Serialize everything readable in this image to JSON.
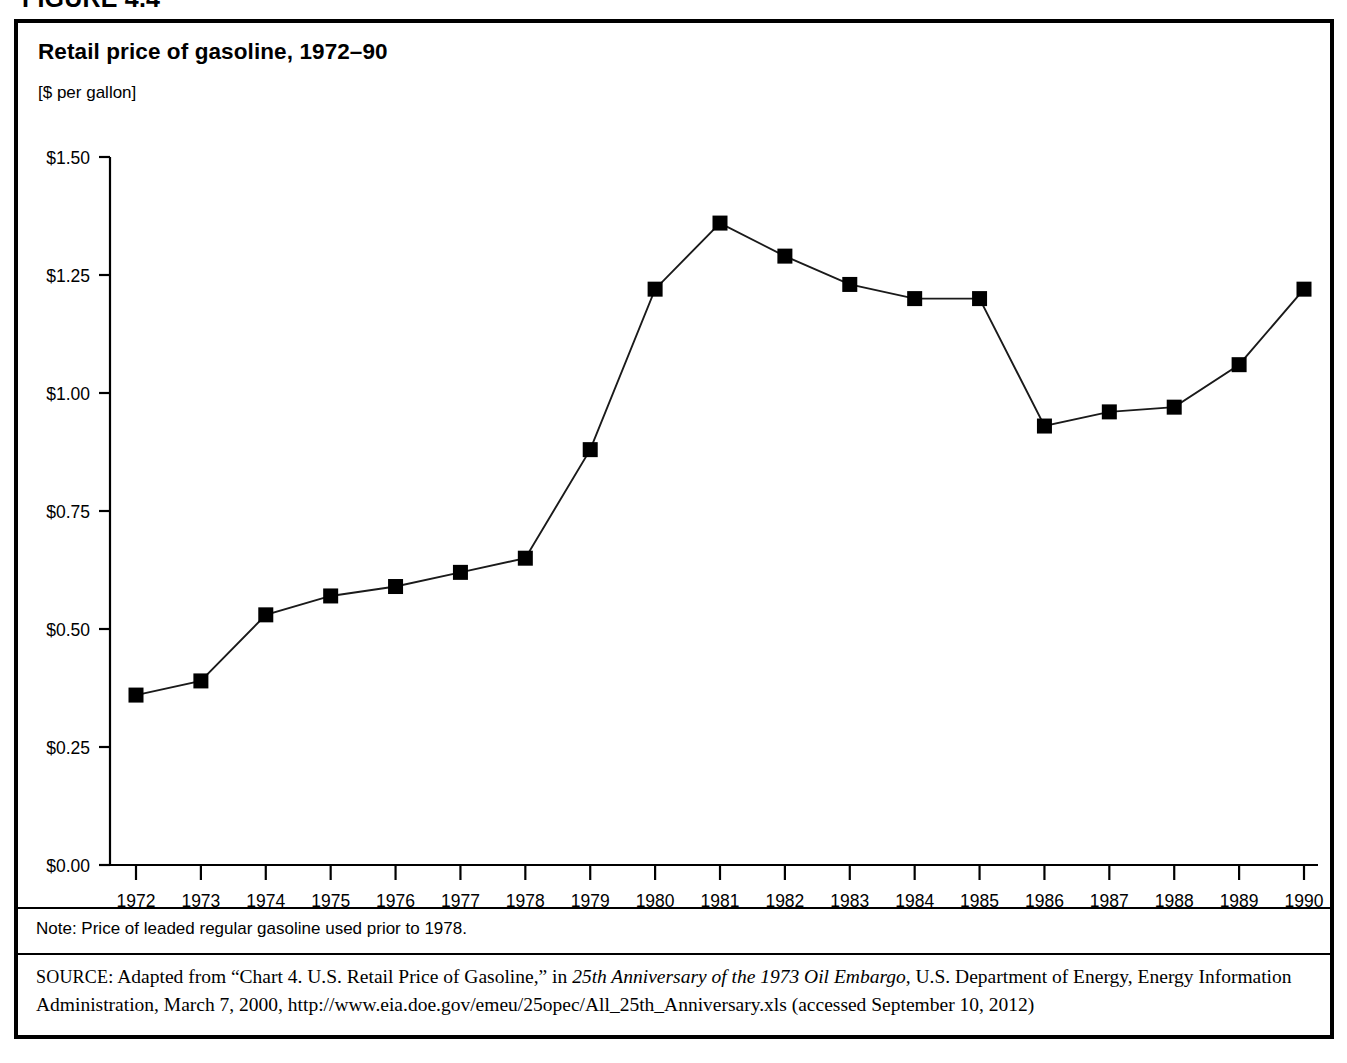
{
  "figure": {
    "label": "FIGURE 4.4"
  },
  "chart": {
    "title": "Retail price of gasoline, 1972–90",
    "units": "[$ per gallon]"
  },
  "footer": {
    "note": "Note: Price of leaded regular gasoline used prior to 1978.",
    "source_prefix": "SOURCE:",
    "source_part1": " Adapted from “Chart 4. U.S. Retail Price of Gasoline,” in ",
    "source_italic": "25th Anniversary of the 1973 Oil Embargo",
    "source_part2": ", U.S. Department of Energy, Energy Information Administration, March 7, 2000, http://www.eia.doe.gov/emeu/25opec/All_25th_Anniversary.xls (accessed September 10, 2012)"
  },
  "chart_data": {
    "type": "line",
    "title": "Retail price of gasoline, 1972–90",
    "subtitle": "[$ per gallon]",
    "xlabel": "",
    "ylabel": "[$ per gallon]",
    "grid": false,
    "legend": null,
    "xlim": [
      1972,
      1990
    ],
    "ylim": [
      0.0,
      1.5
    ],
    "ytick_labels": [
      "$0.00",
      "$0.25",
      "$0.50",
      "$0.75",
      "$1.00",
      "$1.25",
      "$1.50"
    ],
    "ytick_values": [
      0.0,
      0.25,
      0.5,
      0.75,
      1.0,
      1.25,
      1.5
    ],
    "categories": [
      1972,
      1973,
      1974,
      1975,
      1976,
      1977,
      1978,
      1979,
      1980,
      1981,
      1982,
      1983,
      1984,
      1985,
      1986,
      1987,
      1988,
      1989,
      1990
    ],
    "xtick_labels": [
      "1972",
      "1973",
      "1974",
      "1975",
      "1976",
      "1977",
      "1978",
      "1979",
      "1980",
      "1981",
      "1982",
      "1983",
      "1984",
      "1985",
      "1986",
      "1987",
      "1988",
      "1989",
      "1990"
    ],
    "values": [
      0.36,
      0.39,
      0.53,
      0.57,
      0.59,
      0.62,
      0.65,
      0.88,
      1.22,
      1.36,
      1.29,
      1.23,
      1.2,
      1.2,
      0.93,
      0.96,
      0.97,
      1.06,
      1.22
    ],
    "marker": "square",
    "marker_color": "#000000",
    "line_color": "#1a1a1a"
  }
}
